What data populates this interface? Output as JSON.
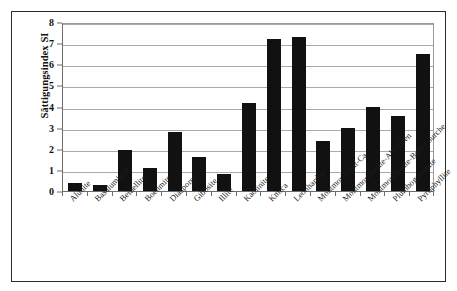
{
  "figure": {
    "y_axis_title": "Sättigungsindex SI"
  },
  "chart_data": {
    "type": "bar",
    "title": "",
    "subtitle": "",
    "xlabel": "",
    "ylabel": "Sättigungsindex SI",
    "ylim": [
      0,
      8
    ],
    "ytick_labels": [
      "0",
      "1",
      "2",
      "3",
      "4",
      "5",
      "6",
      "7",
      "8"
    ],
    "yticks": [
      0,
      1,
      2,
      3,
      4,
      5,
      6,
      7,
      8
    ],
    "grid": true,
    "legend": false,
    "legend_position": "none",
    "bar_color": "#111111",
    "categories": [
      "Alunite",
      "Basaluminite",
      "Beidellite",
      "Boehmite",
      "Diaspore",
      "Gibbsite",
      "Illite",
      "Kaolinite",
      "Kmica",
      "Leonhardite",
      "Montmorillonit-Ca",
      "Montmorillonite-Aberdeen",
      "Montmorillonite-BelleFourche",
      "Plumbogummite",
      "Pyrophyllite"
    ],
    "values": [
      0.4,
      0.3,
      1.95,
      1.1,
      2.8,
      1.6,
      0.8,
      4.15,
      7.2,
      7.3,
      2.35,
      3.0,
      4.0,
      3.55,
      6.5
    ]
  }
}
